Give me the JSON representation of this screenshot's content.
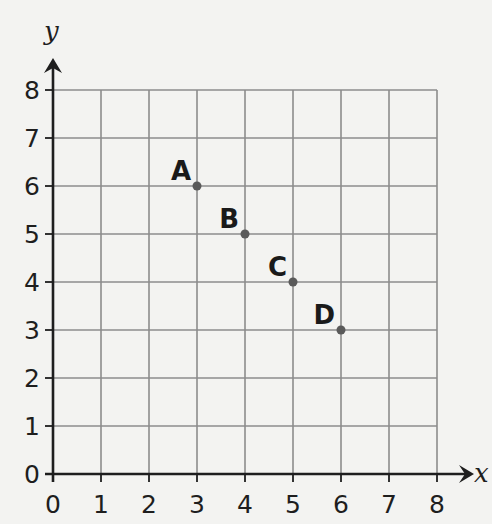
{
  "chart_data": {
    "type": "scatter",
    "title": "",
    "xlabel": "x",
    "ylabel": "y",
    "xlim": [
      0,
      8
    ],
    "ylim": [
      0,
      8
    ],
    "grid": true,
    "x_ticks": [
      "0",
      "1",
      "2",
      "3",
      "4",
      "5",
      "6",
      "7",
      "8"
    ],
    "y_ticks": [
      "0",
      "1",
      "2",
      "3",
      "4",
      "5",
      "6",
      "7",
      "8"
    ],
    "points": [
      {
        "label": "A",
        "x": 3,
        "y": 6
      },
      {
        "label": "B",
        "x": 4,
        "y": 5
      },
      {
        "label": "C",
        "x": 5,
        "y": 4
      },
      {
        "label": "D",
        "x": 6,
        "y": 3
      }
    ]
  },
  "colors": {
    "background": "#f3f3f1",
    "grid": "#8c8c8c",
    "axis": "#1e1e1e",
    "point": "#5a5a5a",
    "text": "#1a1a1a"
  },
  "layout": {
    "origin_x": 53,
    "origin_y": 474,
    "unit": 48
  }
}
